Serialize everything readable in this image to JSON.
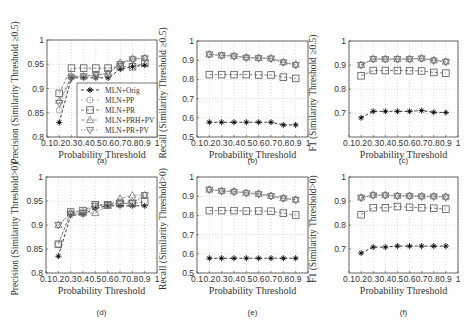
{
  "figure": {
    "legend": [
      "MLN+Orig",
      "MLN+PP",
      "MLN+PR",
      "MLN+PRH+PV",
      "MLN+PR+PV"
    ]
  },
  "chart_data": [
    {
      "id": "a",
      "caption": "(a)",
      "type": "line",
      "xlabel": "Probability Threshold",
      "ylabel": "Precision (Similarity Threshold ≥0.5)",
      "xlim": [
        0.1,
        1
      ],
      "ylim": [
        0.8,
        1
      ],
      "xticks": [
        "0.1",
        "0.2",
        "0.3",
        "0.4",
        "0.5",
        "0.6",
        "0.7",
        "0.8",
        "0.9",
        "1"
      ],
      "yticks": [
        "0.8",
        "0.85",
        "0.9",
        "0.95",
        "1"
      ],
      "grid": true,
      "legend_position": "lower right",
      "x": [
        0.2,
        0.3,
        0.4,
        0.5,
        0.6,
        0.7,
        0.8,
        0.9
      ],
      "series": [
        {
          "name": "MLN+Orig",
          "marker": "star",
          "values": [
            0.83,
            0.922,
            0.922,
            0.922,
            0.922,
            0.94,
            0.945,
            0.948
          ]
        },
        {
          "name": "MLN+PP",
          "marker": "circle",
          "values": [
            0.855,
            0.925,
            0.925,
            0.928,
            0.93,
            0.95,
            0.96,
            0.962
          ]
        },
        {
          "name": "MLN+PR",
          "marker": "square",
          "values": [
            0.89,
            0.942,
            0.942,
            0.942,
            0.942,
            0.945,
            0.945,
            0.952
          ]
        },
        {
          "name": "MLN+PRH+PV",
          "marker": "triangle-up",
          "values": [
            0.875,
            0.925,
            0.925,
            0.928,
            0.93,
            0.953,
            0.962,
            0.963
          ]
        },
        {
          "name": "MLN+PR+PV",
          "marker": "triangle-down",
          "values": [
            0.87,
            0.922,
            0.925,
            0.928,
            0.932,
            0.95,
            0.96,
            0.962
          ]
        }
      ]
    },
    {
      "id": "b",
      "caption": "(b)",
      "type": "line",
      "xlabel": "Probability Threshold",
      "ylabel": "Recall (Similarity Threshold ≥0.5)",
      "xlim": [
        0.1,
        1
      ],
      "ylim": [
        0.5,
        1
      ],
      "xticks": [
        "0.1",
        "0.2",
        "0.3",
        "0.4",
        "0.5",
        "0.6",
        "0.7",
        "0.8",
        "0.9",
        "1"
      ],
      "yticks": [
        "0.5",
        "0.6",
        "0.7",
        "0.8",
        "0.9",
        "1"
      ],
      "grid": true,
      "x": [
        0.2,
        0.3,
        0.4,
        0.5,
        0.6,
        0.7,
        0.8,
        0.9
      ],
      "series": [
        {
          "name": "MLN+Orig",
          "marker": "star",
          "values": [
            0.577,
            0.577,
            0.577,
            0.577,
            0.577,
            0.577,
            0.563,
            0.563
          ]
        },
        {
          "name": "MLN+PP",
          "marker": "circle",
          "values": [
            0.93,
            0.925,
            0.922,
            0.915,
            0.912,
            0.91,
            0.89,
            0.875
          ]
        },
        {
          "name": "MLN+PR",
          "marker": "square",
          "values": [
            0.825,
            0.825,
            0.825,
            0.825,
            0.823,
            0.823,
            0.812,
            0.805
          ]
        },
        {
          "name": "MLN+PRH+PV",
          "marker": "triangle-up",
          "values": [
            0.93,
            0.925,
            0.922,
            0.915,
            0.912,
            0.91,
            0.89,
            0.878
          ]
        },
        {
          "name": "MLN+PR+PV",
          "marker": "triangle-down",
          "values": [
            0.93,
            0.925,
            0.92,
            0.912,
            0.91,
            0.908,
            0.888,
            0.875
          ]
        }
      ]
    },
    {
      "id": "c",
      "caption": "(c)",
      "type": "line",
      "xlabel": "Probability Threshold",
      "ylabel": "F1 (Similarity Threshold ≥0.5)",
      "xlim": [
        0.1,
        1
      ],
      "ylim": [
        0.6,
        1
      ],
      "xticks": [
        "0.1",
        "0.2",
        "0.3",
        "0.4",
        "0.5",
        "0.6",
        "0.7",
        "0.8",
        "0.9",
        "1"
      ],
      "yticks": [
        "0.7",
        "0.8",
        "0.9",
        "1"
      ],
      "grid": true,
      "x": [
        0.2,
        0.3,
        0.4,
        0.5,
        0.6,
        0.7,
        0.8,
        0.9
      ],
      "series": [
        {
          "name": "MLN+Orig",
          "marker": "star",
          "values": [
            0.68,
            0.707,
            0.707,
            0.707,
            0.707,
            0.71,
            0.703,
            0.702
          ]
        },
        {
          "name": "MLN+PP",
          "marker": "circle",
          "values": [
            0.9,
            0.925,
            0.925,
            0.925,
            0.925,
            0.927,
            0.92,
            0.915
          ]
        },
        {
          "name": "MLN+PR",
          "marker": "square",
          "values": [
            0.855,
            0.877,
            0.877,
            0.877,
            0.876,
            0.875,
            0.869,
            0.866
          ]
        },
        {
          "name": "MLN+PRH+PV",
          "marker": "triangle-up",
          "values": [
            0.9,
            0.925,
            0.925,
            0.925,
            0.925,
            0.928,
            0.92,
            0.915
          ]
        },
        {
          "name": "MLN+PR+PV",
          "marker": "triangle-down",
          "values": [
            0.9,
            0.924,
            0.924,
            0.924,
            0.924,
            0.927,
            0.918,
            0.913
          ]
        }
      ]
    },
    {
      "id": "d",
      "caption": "(d)",
      "type": "line",
      "xlabel": "Probability Threshold",
      "ylabel": "Precision (Similarity Threshold>0)",
      "xlim": [
        0.1,
        1
      ],
      "ylim": [
        0.8,
        1
      ],
      "xticks": [
        "0.1",
        "0.2",
        "0.3",
        "0.4",
        "0.5",
        "0.6",
        "0.7",
        "0.8",
        "0.9",
        "1"
      ],
      "yticks": [
        "0.8",
        "0.85",
        "0.9",
        "0.95",
        "1"
      ],
      "grid": true,
      "x": [
        0.2,
        0.3,
        0.4,
        0.5,
        0.6,
        0.7,
        0.8,
        0.9
      ],
      "series": [
        {
          "name": "MLN+Orig",
          "marker": "star",
          "values": [
            0.835,
            0.92,
            0.922,
            0.935,
            0.94,
            0.94,
            0.94,
            0.94
          ]
        },
        {
          "name": "MLN+PP",
          "marker": "circle",
          "values": [
            0.86,
            0.925,
            0.928,
            0.94,
            0.942,
            0.948,
            0.948,
            0.962
          ]
        },
        {
          "name": "MLN+PR",
          "marker": "square",
          "values": [
            0.86,
            0.927,
            0.93,
            0.942,
            0.942,
            0.945,
            0.945,
            0.948
          ]
        },
        {
          "name": "MLN+PRH+PV",
          "marker": "triangle-up",
          "values": [
            0.9,
            0.925,
            0.925,
            0.925,
            0.94,
            0.955,
            0.962,
            0.962
          ]
        },
        {
          "name": "MLN+PR+PV",
          "marker": "triangle-down",
          "values": [
            0.9,
            0.922,
            0.925,
            0.94,
            0.942,
            0.945,
            0.945,
            0.962
          ]
        }
      ]
    },
    {
      "id": "e",
      "caption": "(e)",
      "type": "line",
      "xlabel": "Probability Threshold",
      "ylabel": "Recall (Similarity Threshold>0)",
      "xlim": [
        0.1,
        1
      ],
      "ylim": [
        0.5,
        1
      ],
      "xticks": [
        "0.1",
        "0.2",
        "0.3",
        "0.4",
        "0.5",
        "0.6",
        "0.7",
        "0.8",
        "0.9",
        "1"
      ],
      "yticks": [
        "0.5",
        "0.6",
        "0.7",
        "0.8",
        "0.9",
        "1"
      ],
      "grid": true,
      "x": [
        0.2,
        0.3,
        0.4,
        0.5,
        0.6,
        0.7,
        0.8,
        0.9
      ],
      "series": [
        {
          "name": "MLN+Orig",
          "marker": "star",
          "values": [
            0.577,
            0.577,
            0.577,
            0.577,
            0.577,
            0.577,
            0.577,
            0.577
          ]
        },
        {
          "name": "MLN+PP",
          "marker": "circle",
          "values": [
            0.935,
            0.928,
            0.925,
            0.918,
            0.913,
            0.902,
            0.89,
            0.882
          ]
        },
        {
          "name": "MLN+PR",
          "marker": "square",
          "values": [
            0.825,
            0.825,
            0.825,
            0.823,
            0.823,
            0.822,
            0.812,
            0.802
          ]
        },
        {
          "name": "MLN+PRH+PV",
          "marker": "triangle-up",
          "values": [
            0.935,
            0.928,
            0.925,
            0.918,
            0.913,
            0.902,
            0.89,
            0.882
          ]
        },
        {
          "name": "MLN+PR+PV",
          "marker": "triangle-down",
          "values": [
            0.933,
            0.926,
            0.922,
            0.915,
            0.91,
            0.9,
            0.888,
            0.88
          ]
        }
      ]
    },
    {
      "id": "f",
      "caption": "(f)",
      "type": "line",
      "xlabel": "Probability Threshold",
      "ylabel": "F1 (Similarity Threshold>0)",
      "xlim": [
        0.1,
        1
      ],
      "ylim": [
        0.6,
        1
      ],
      "xticks": [
        "0.1",
        "0.2",
        "0.3",
        "0.4",
        "0.5",
        "0.6",
        "0.7",
        "0.8",
        "0.9",
        "1"
      ],
      "yticks": [
        "0.7",
        "0.8",
        "0.9",
        "1"
      ],
      "grid": true,
      "x": [
        0.2,
        0.3,
        0.4,
        0.5,
        0.6,
        0.7,
        0.8,
        0.9
      ],
      "series": [
        {
          "name": "MLN+Orig",
          "marker": "star",
          "values": [
            0.683,
            0.708,
            0.708,
            0.712,
            0.712,
            0.712,
            0.712,
            0.712
          ]
        },
        {
          "name": "MLN+PP",
          "marker": "circle",
          "values": [
            0.915,
            0.925,
            0.925,
            0.922,
            0.922,
            0.92,
            0.92,
            0.918
          ]
        },
        {
          "name": "MLN+PR",
          "marker": "square",
          "values": [
            0.843,
            0.872,
            0.872,
            0.877,
            0.874,
            0.872,
            0.87,
            0.866
          ]
        },
        {
          "name": "MLN+PRH+PV",
          "marker": "triangle-up",
          "values": [
            0.915,
            0.925,
            0.925,
            0.922,
            0.922,
            0.92,
            0.92,
            0.918
          ]
        },
        {
          "name": "MLN+PR+PV",
          "marker": "triangle-down",
          "values": [
            0.913,
            0.923,
            0.923,
            0.92,
            0.92,
            0.918,
            0.918,
            0.915
          ]
        }
      ]
    }
  ]
}
